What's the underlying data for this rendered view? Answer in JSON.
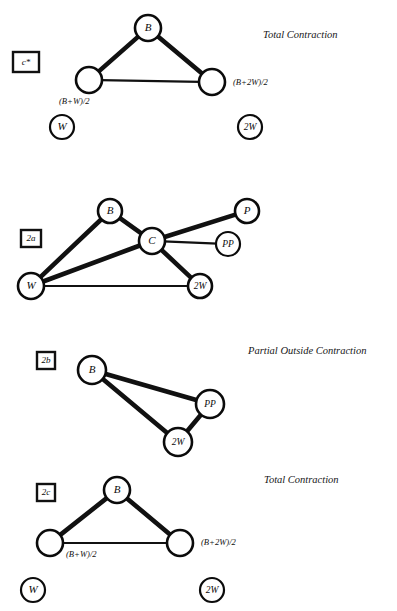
{
  "figure": {
    "background_color": "#ffffff",
    "ink_color": "#111111",
    "panels": [
      {
        "id": "panel-1",
        "tag": "c*",
        "caption": "Total Contraction",
        "nodes": [
          {
            "name": "node-b",
            "label": "B",
            "cx": 148,
            "cy": 28,
            "r": 13,
            "style": "thick"
          },
          {
            "name": "node-bw2",
            "label": "",
            "cx": 89,
            "cy": 80,
            "r": 13,
            "style": "thick"
          },
          {
            "name": "node-b2w2",
            "label": "",
            "cx": 212,
            "cy": 82,
            "r": 13,
            "style": "thick"
          },
          {
            "name": "node-w",
            "label": "W",
            "cx": 62,
            "cy": 127,
            "r": 12,
            "style": "thin"
          },
          {
            "name": "node-2w",
            "label": "2W",
            "cx": 250,
            "cy": 127,
            "r": 12,
            "style": "thin"
          }
        ],
        "edges": [
          {
            "name": "edge-b-bw2",
            "from": "node-b",
            "to": "node-bw2",
            "weight": "thick"
          },
          {
            "name": "edge-b-b2w2",
            "from": "node-b",
            "to": "node-b2w2",
            "weight": "thick"
          },
          {
            "name": "edge-bw2-b2w2",
            "from": "node-bw2",
            "to": "node-b2w2",
            "weight": "thin"
          }
        ],
        "annotations": [
          {
            "name": "formula-bw2",
            "text": "(B+W)/2",
            "x": 59,
            "y": 104
          },
          {
            "name": "formula-b2w2",
            "text": "(B+2W)/2",
            "x": 233,
            "y": 85
          }
        ]
      },
      {
        "id": "panel-2",
        "tag": "2a",
        "caption": "",
        "nodes": [
          {
            "name": "node-b",
            "label": "B",
            "cx": 110,
            "cy": 211,
            "r": 12,
            "style": "thick"
          },
          {
            "name": "node-c",
            "label": "C",
            "cx": 152,
            "cy": 241,
            "r": 13,
            "style": "thick"
          },
          {
            "name": "node-p",
            "label": "P",
            "cx": 247,
            "cy": 211,
            "r": 12,
            "style": "thick"
          },
          {
            "name": "node-pp",
            "label": "PP",
            "cx": 228,
            "cy": 244,
            "r": 12,
            "style": "thin"
          },
          {
            "name": "node-w",
            "label": "W",
            "cx": 31,
            "cy": 286,
            "r": 13,
            "style": "thick"
          },
          {
            "name": "node-2w",
            "label": "2W",
            "cx": 200,
            "cy": 286,
            "r": 12,
            "style": "thick"
          }
        ],
        "edges": [
          {
            "name": "edge-b-c",
            "from": "node-b",
            "to": "node-c",
            "weight": "thick"
          },
          {
            "name": "edge-b-w",
            "from": "node-b",
            "to": "node-w",
            "weight": "thick"
          },
          {
            "name": "edge-c-p",
            "from": "node-c",
            "to": "node-p",
            "weight": "thick"
          },
          {
            "name": "edge-c-pp",
            "from": "node-c",
            "to": "node-pp",
            "weight": "thin"
          },
          {
            "name": "edge-c-w",
            "from": "node-c",
            "to": "node-w",
            "weight": "thick"
          },
          {
            "name": "edge-c-2w",
            "from": "node-c",
            "to": "node-2w",
            "weight": "thick"
          },
          {
            "name": "edge-w-2w",
            "from": "node-w",
            "to": "node-2w",
            "weight": "thin"
          }
        ],
        "annotations": []
      },
      {
        "id": "panel-3",
        "tag": "2b",
        "caption": "Partial Outside Contraction",
        "nodes": [
          {
            "name": "node-b",
            "label": "B",
            "cx": 92,
            "cy": 370,
            "r": 14,
            "style": "thick"
          },
          {
            "name": "node-pp",
            "label": "PP",
            "cx": 210,
            "cy": 404,
            "r": 14,
            "style": "thick"
          },
          {
            "name": "node-2w",
            "label": "2W",
            "cx": 178,
            "cy": 442,
            "r": 14,
            "style": "thick"
          }
        ],
        "edges": [
          {
            "name": "edge-b-pp",
            "from": "node-b",
            "to": "node-pp",
            "weight": "thick"
          },
          {
            "name": "edge-b-2w",
            "from": "node-b",
            "to": "node-2w",
            "weight": "thick"
          },
          {
            "name": "edge-pp-2w",
            "from": "node-pp",
            "to": "node-2w",
            "weight": "thick"
          }
        ],
        "annotations": []
      },
      {
        "id": "panel-4",
        "tag": "2c",
        "caption": "Total Contraction",
        "nodes": [
          {
            "name": "node-b",
            "label": "B",
            "cx": 117,
            "cy": 490,
            "r": 13,
            "style": "thick"
          },
          {
            "name": "node-bw2",
            "label": "",
            "cx": 50,
            "cy": 543,
            "r": 13,
            "style": "thick"
          },
          {
            "name": "node-b2w2",
            "label": "",
            "cx": 180,
            "cy": 543,
            "r": 13,
            "style": "thick"
          },
          {
            "name": "node-w",
            "label": "W",
            "cx": 33,
            "cy": 590,
            "r": 12,
            "style": "thin"
          },
          {
            "name": "node-2w",
            "label": "2W",
            "cx": 212,
            "cy": 590,
            "r": 12,
            "style": "thin"
          }
        ],
        "edges": [
          {
            "name": "edge-b-bw2",
            "from": "node-b",
            "to": "node-bw2",
            "weight": "thick"
          },
          {
            "name": "edge-b-b2w2",
            "from": "node-b",
            "to": "node-b2w2",
            "weight": "thick"
          },
          {
            "name": "edge-bw2-b2w2",
            "from": "node-bw2",
            "to": "node-b2w2",
            "weight": "thin"
          }
        ],
        "annotations": [
          {
            "name": "formula-bw2",
            "text": "(B+W)/2",
            "x": 66,
            "y": 557
          },
          {
            "name": "formula-b2w2",
            "text": "(B+2W)/2",
            "x": 201,
            "y": 545
          }
        ]
      }
    ],
    "captions": [
      {
        "name": "caption-panel-1",
        "text": "Total Contraction",
        "x": 263,
        "y": 38
      },
      {
        "name": "caption-panel-3",
        "text": "Partial Outside Contraction",
        "x": 248,
        "y": 354
      },
      {
        "name": "caption-panel-4",
        "text": "Total Contraction",
        "x": 264,
        "y": 483
      }
    ],
    "tags": [
      {
        "name": "tag-panel-1",
        "text": "c*",
        "x": 13,
        "y": 52,
        "w": 26,
        "h": 20
      },
      {
        "name": "tag-panel-2",
        "text": "2a",
        "x": 21,
        "y": 230,
        "w": 20,
        "h": 17
      },
      {
        "name": "tag-panel-3",
        "text": "2b",
        "x": 37,
        "y": 352,
        "w": 18,
        "h": 17
      },
      {
        "name": "tag-panel-4",
        "text": "2c",
        "x": 37,
        "y": 484,
        "w": 18,
        "h": 17
      }
    ]
  }
}
